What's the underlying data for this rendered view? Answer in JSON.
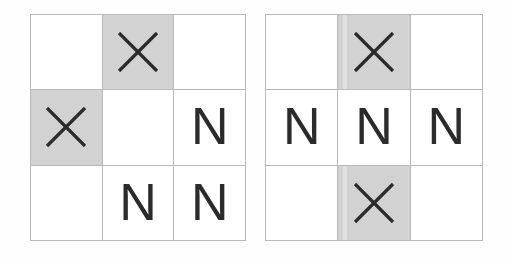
{
  "figure": {
    "background_color": "#fefefe",
    "grid_line_color": "#b9b9b9",
    "shaded_cell_color": "#d2d2d2",
    "empty_cell_color": "#ffffff",
    "glyph_color": "#2b2b2b",
    "symbols": {
      "x": "X",
      "n": "N",
      "empty": ""
    }
  },
  "grids": [
    {
      "name": "left-grid",
      "rows": 3,
      "columns": 3,
      "cells": [
        {
          "row": 1,
          "col": 1,
          "symbol": "",
          "shaded": false
        },
        {
          "row": 1,
          "col": 2,
          "symbol": "X",
          "shaded": true
        },
        {
          "row": 1,
          "col": 3,
          "symbol": "",
          "shaded": false
        },
        {
          "row": 2,
          "col": 1,
          "symbol": "X",
          "shaded": true
        },
        {
          "row": 2,
          "col": 2,
          "symbol": "",
          "shaded": false
        },
        {
          "row": 2,
          "col": 3,
          "symbol": "N",
          "shaded": false
        },
        {
          "row": 3,
          "col": 1,
          "symbol": "",
          "shaded": false
        },
        {
          "row": 3,
          "col": 2,
          "symbol": "N",
          "shaded": false
        },
        {
          "row": 3,
          "col": 3,
          "symbol": "N",
          "shaded": false
        }
      ]
    },
    {
      "name": "right-grid",
      "rows": 3,
      "columns": 3,
      "cells": [
        {
          "row": 1,
          "col": 1,
          "symbol": "",
          "shaded": false
        },
        {
          "row": 1,
          "col": 2,
          "symbol": "X",
          "shaded": true
        },
        {
          "row": 1,
          "col": 3,
          "symbol": "",
          "shaded": false
        },
        {
          "row": 2,
          "col": 1,
          "symbol": "N",
          "shaded": false
        },
        {
          "row": 2,
          "col": 2,
          "symbol": "N",
          "shaded": false
        },
        {
          "row": 2,
          "col": 3,
          "symbol": "N",
          "shaded": false
        },
        {
          "row": 3,
          "col": 1,
          "symbol": "",
          "shaded": false
        },
        {
          "row": 3,
          "col": 2,
          "symbol": "X",
          "shaded": true
        },
        {
          "row": 3,
          "col": 3,
          "symbol": "",
          "shaded": false
        }
      ]
    }
  ]
}
